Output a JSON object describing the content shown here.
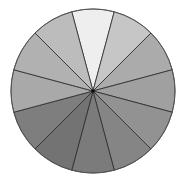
{
  "chart_data": {
    "type": "pie",
    "title": "",
    "categories": [
      "1",
      "2",
      "3",
      "4",
      "5",
      "6",
      "7",
      "8",
      "9",
      "10",
      "11",
      "12"
    ],
    "values": [
      1,
      1,
      1,
      1,
      1,
      1,
      1,
      1,
      1,
      1,
      1,
      1
    ],
    "colors": [
      "#eeeeee",
      "#c6c6c6",
      "#ababab",
      "#a0a0a0",
      "#929292",
      "#858585",
      "#7b7b7b",
      "#737373",
      "#7e7e7e",
      "#a9a9a9",
      "#b1b1b1",
      "#bcbcbc"
    ],
    "start_angle_deg": -15,
    "direction": "clockwise",
    "legend": "none"
  },
  "geometry": {
    "cx": 93,
    "cy": 91,
    "r": 82,
    "stroke": "#2a2a2a"
  }
}
